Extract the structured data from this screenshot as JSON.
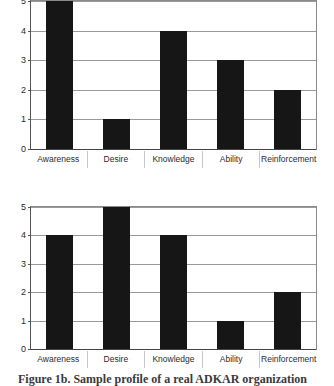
{
  "figure": {
    "caption_text": "Figure 1b. Sample profile of a real ADKAR organization",
    "caption_visible": "partially clipped by image bottom edge"
  },
  "chart_data": [
    {
      "type": "bar",
      "title": "",
      "xlabel": "",
      "ylabel": "",
      "categories": [
        "Awareness",
        "Desire",
        "Knowledge",
        "Ability",
        "Reinforcement"
      ],
      "values": [
        5,
        1,
        4,
        3,
        2
      ],
      "ylim": [
        0,
        5
      ],
      "yticks": [
        0,
        1,
        2,
        3,
        4,
        5
      ],
      "grid": true,
      "legend": "none",
      "bar_color": "#161616",
      "note": "top chart; 5 tick label and Awareness bar top are cropped by image edge"
    },
    {
      "type": "bar",
      "title": "",
      "xlabel": "",
      "ylabel": "",
      "categories": [
        "Awareness",
        "Desire",
        "Knowledge",
        "Ability",
        "Reinforcement"
      ],
      "values": [
        4,
        5,
        4,
        1,
        2
      ],
      "ylim": [
        0,
        5
      ],
      "yticks": [
        0,
        1,
        2,
        3,
        4,
        5
      ],
      "grid": true,
      "legend": "none",
      "bar_color": "#161616",
      "note": "bottom chart"
    }
  ]
}
